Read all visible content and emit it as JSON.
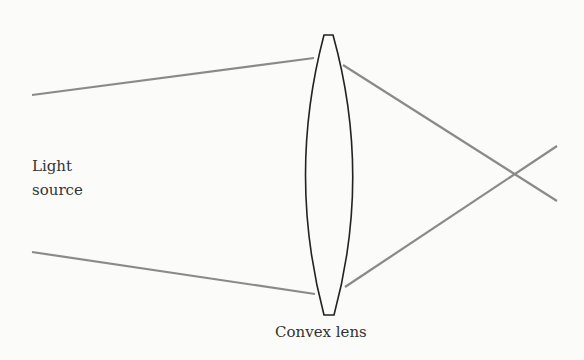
{
  "diagram": {
    "labels": {
      "light_source_line1": "Light",
      "light_source_line2": "source",
      "lens": "Convex lens"
    },
    "colors": {
      "ray": "#8a8a8a",
      "lens_outline": "#222222",
      "text": "#333333",
      "background": "#fbfbfa"
    },
    "elements": {
      "lens": {
        "top": [
          324,
          35,
          333,
          35
        ],
        "bottom": [
          324,
          315,
          334,
          315
        ],
        "left_x_mid": 301,
        "right_x_mid": 358
      },
      "rays": [
        {
          "name": "upper-incoming",
          "from": [
            32,
            95
          ],
          "to": [
            314,
            58
          ]
        },
        {
          "name": "upper-refracted",
          "from": [
            343,
            65
          ],
          "to": [
            557,
            201
          ]
        },
        {
          "name": "lower-incoming",
          "from": [
            32,
            252
          ],
          "to": [
            315,
            294
          ]
        },
        {
          "name": "lower-refracted",
          "from": [
            345,
            287
          ],
          "to": [
            557,
            146
          ]
        }
      ],
      "focal_point": [
        515,
        175
      ]
    }
  }
}
